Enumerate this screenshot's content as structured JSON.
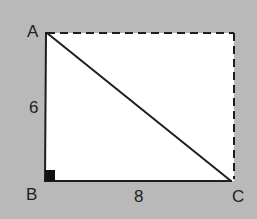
{
  "diagram": {
    "type": "geometry-figure",
    "background_color": "#b9b9b9",
    "fill_color": "#ffffff",
    "line_color": "#1e1e1e",
    "vertices": [
      {
        "label": "A",
        "x": 47,
        "y": 33
      },
      {
        "label": "B",
        "x": 45,
        "y": 181
      },
      {
        "label": "C",
        "x": 231,
        "y": 181
      }
    ],
    "dashed_corner": {
      "x": 234,
      "y": 33
    },
    "edges": [
      {
        "from": "A",
        "to": "B",
        "style": "solid",
        "length_label": "6"
      },
      {
        "from": "B",
        "to": "C",
        "style": "solid",
        "length_label": "8"
      },
      {
        "from": "A",
        "to": "C",
        "style": "solid",
        "length_label": ""
      },
      {
        "from": "A",
        "to": "D",
        "style": "dashed",
        "length_label": ""
      },
      {
        "from": "D",
        "to": "C",
        "style": "dashed",
        "length_label": ""
      }
    ],
    "right_angle_at": "B",
    "labels": {
      "a": "A",
      "b": "B",
      "c": "C",
      "side_ab": "6",
      "side_bc": "8"
    }
  }
}
